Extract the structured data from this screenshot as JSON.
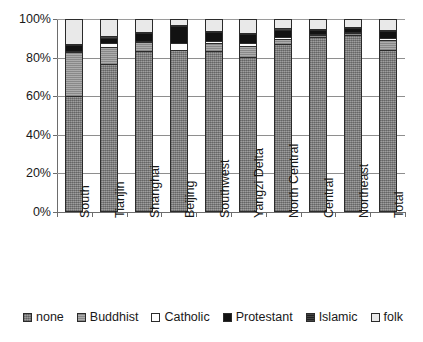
{
  "chart_data": {
    "type": "bar",
    "subtype": "100% stacked column",
    "title": "",
    "subtitle": "",
    "xlabel": "",
    "ylabel": "",
    "ylim": [
      0,
      100
    ],
    "y_unit": "%",
    "grid": true,
    "legend_position": "bottom",
    "y_ticks": [
      "0%",
      "20%",
      "40%",
      "60%",
      "80%",
      "100%"
    ],
    "y_tick_values": [
      0,
      20,
      40,
      60,
      80,
      100
    ],
    "categories": [
      "South",
      "Tianjin",
      "Shanghai",
      "Beijing",
      "Southwest",
      "Yangzi Delta",
      "North Central",
      "Central",
      "Northeast",
      "Total"
    ],
    "series": [
      {
        "name": "none",
        "color": "#8a8a8a",
        "values": [
          60.0,
          77.0,
          84.0,
          84.5,
          84.0,
          80.5,
          87.5,
          91.0,
          92.0,
          84.5
        ]
      },
      {
        "name": "Buddhist",
        "color": "#9d9d9d",
        "values": [
          23.5,
          9.0,
          4.5,
          0.0,
          4.0,
          6.0,
          2.5,
          1.0,
          1.0,
          5.0
        ]
      },
      {
        "name": "Catholic",
        "color": "#fdfdfd",
        "values": [
          0.5,
          2.0,
          0.5,
          3.5,
          1.0,
          1.5,
          1.0,
          0.5,
          0.5,
          1.0
        ]
      },
      {
        "name": "Protestant",
        "color": "#121212",
        "values": [
          3.0,
          2.5,
          4.0,
          9.0,
          4.5,
          4.5,
          4.0,
          2.5,
          2.5,
          4.0
        ]
      },
      {
        "name": "Islamic",
        "color": "#2e2e2e",
        "values": [
          0.5,
          1.0,
          0.5,
          0.5,
          0.5,
          0.5,
          1.0,
          0.5,
          0.5,
          0.5
        ]
      },
      {
        "name": "folk",
        "color": "#e9e9e9",
        "values": [
          12.5,
          8.5,
          6.5,
          2.5,
          6.0,
          7.0,
          4.0,
          4.5,
          3.5,
          5.0
        ]
      }
    ]
  },
  "legend": {
    "entries": [
      {
        "label": "none",
        "swatch": "legend-swatch-none"
      },
      {
        "label": "Buddhist",
        "swatch": "legend-swatch-buddhist"
      },
      {
        "label": "Catholic",
        "swatch": "legend-swatch-catholic"
      },
      {
        "label": "Protestant",
        "swatch": "legend-swatch-protestant"
      },
      {
        "label": "Islamic",
        "swatch": "legend-swatch-islamic"
      },
      {
        "label": "folk",
        "swatch": "legend-swatch-folk"
      }
    ]
  }
}
